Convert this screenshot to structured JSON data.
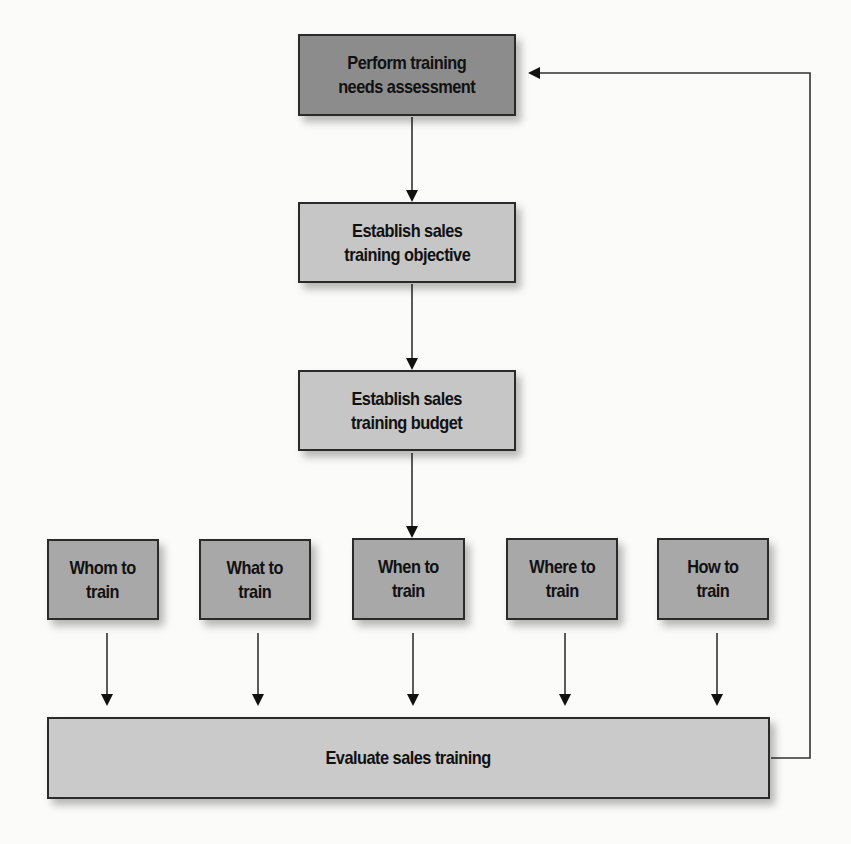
{
  "diagram": {
    "type": "flowchart",
    "colors": {
      "dark_box": "#8c8c8c",
      "light_box": "#c6c6c6",
      "medium_box": "#a8a8a8",
      "evaluate_box": "#cacaca",
      "line": "#222222"
    },
    "nodes": {
      "needs_assessment": {
        "label": "Perform training\nneeds assessment"
      },
      "objective": {
        "label": "Establish sales\ntraining objective"
      },
      "budget": {
        "label": "Establish sales\ntraining budget"
      },
      "whom": {
        "label": "Whom to\ntrain"
      },
      "what": {
        "label": "What to\ntrain"
      },
      "when": {
        "label": "When to\ntrain"
      },
      "where": {
        "label": "Where to\ntrain"
      },
      "how": {
        "label": "How to\ntrain"
      },
      "evaluate": {
        "label": "Evaluate sales training"
      }
    },
    "edges": [
      {
        "from": "needs_assessment",
        "to": "objective"
      },
      {
        "from": "objective",
        "to": "budget"
      },
      {
        "from": "budget",
        "to": "when"
      },
      {
        "from": "whom",
        "to": "evaluate"
      },
      {
        "from": "what",
        "to": "evaluate"
      },
      {
        "from": "when",
        "to": "evaluate"
      },
      {
        "from": "where",
        "to": "evaluate"
      },
      {
        "from": "how",
        "to": "evaluate"
      },
      {
        "from": "evaluate",
        "to": "needs_assessment",
        "kind": "feedback-loop"
      }
    ]
  }
}
